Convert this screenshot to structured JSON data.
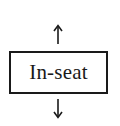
{
  "diagram": {
    "node": {
      "label": "In-seat"
    },
    "arrows": [
      {
        "direction": "up"
      },
      {
        "direction": "down"
      }
    ],
    "colors": {
      "stroke": "#1a1a1a",
      "background": "#ffffff"
    }
  }
}
